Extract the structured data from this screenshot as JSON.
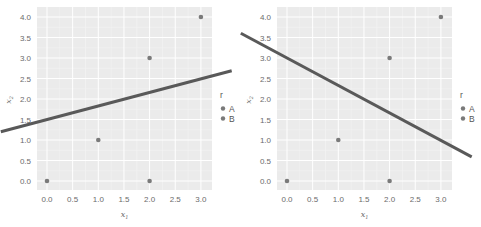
{
  "chart_data": [
    {
      "type": "scatter",
      "title": "",
      "xlabel": "x1",
      "ylabel": "x2",
      "xlim": [
        -0.2,
        3.2
      ],
      "ylim": [
        -0.2,
        4.2
      ],
      "xticks": [
        "0.0",
        "0.5",
        "1.0",
        "1.5",
        "2.0",
        "2.5",
        "3.0"
      ],
      "yticks": [
        "0.0",
        "0.5",
        "1.0",
        "1.5",
        "2.0",
        "2.5",
        "3.0",
        "3.5",
        "4.0"
      ],
      "grid": true,
      "legend": {
        "title": "r",
        "entries": [
          "A",
          "B"
        ],
        "position": "right"
      },
      "points": [
        {
          "x": 0,
          "y": 0,
          "r": "A"
        },
        {
          "x": 1,
          "y": 1,
          "r": "A"
        },
        {
          "x": 2,
          "y": 0,
          "r": "B"
        },
        {
          "x": 2,
          "y": 3,
          "r": "A"
        },
        {
          "x": 3,
          "y": 4,
          "r": "B"
        }
      ],
      "line": {
        "intercept": 1.5,
        "slope": 0.33
      }
    },
    {
      "type": "scatter",
      "title": "",
      "xlabel": "x1",
      "ylabel": "x2",
      "xlim": [
        -0.2,
        3.2
      ],
      "ylim": [
        -0.2,
        4.2
      ],
      "xticks": [
        "0.0",
        "0.5",
        "1.0",
        "1.5",
        "2.0",
        "2.5",
        "3.0"
      ],
      "yticks": [
        "0.0",
        "0.5",
        "1.0",
        "1.5",
        "2.0",
        "2.5",
        "3.0",
        "3.5",
        "4.0"
      ],
      "grid": true,
      "legend": {
        "title": "r",
        "entries": [
          "A",
          "B"
        ],
        "position": "right"
      },
      "points": [
        {
          "x": 0,
          "y": 0,
          "r": "A"
        },
        {
          "x": 1,
          "y": 1,
          "r": "A"
        },
        {
          "x": 2,
          "y": 0,
          "r": "B"
        },
        {
          "x": 2,
          "y": 3,
          "r": "A"
        },
        {
          "x": 3,
          "y": 4,
          "r": "B"
        }
      ],
      "line": {
        "intercept": 3.0,
        "slope": -0.67
      }
    }
  ],
  "colors": {
    "panel_bg": "#ebebeb",
    "grid": "#ffffff",
    "point": "#7a7a7a",
    "line": "#595959",
    "text": "#6b6b6b"
  }
}
